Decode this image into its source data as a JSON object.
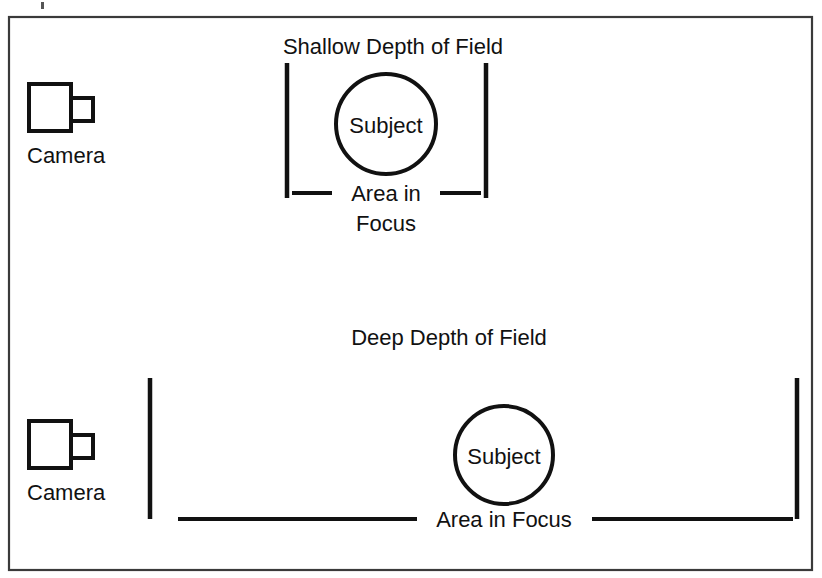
{
  "figure": {
    "title_top": "Shallow Depth of Field",
    "title_bottom": "Deep Depth of Field",
    "background_color": "#ffffff",
    "ink_color": "#111111",
    "frame_color": "#3a3a3a"
  },
  "shallow": {
    "heading": "Shallow Depth of Field",
    "camera_label": "Camera",
    "subject_label": "Subject",
    "focus_label_line1": "Area in",
    "focus_label_line2": "Focus",
    "focus_label_full": "Area in Focus"
  },
  "deep": {
    "heading": "Deep Depth of Field",
    "camera_label": "Camera",
    "subject_label": "Subject",
    "focus_label": "Area in Focus"
  }
}
